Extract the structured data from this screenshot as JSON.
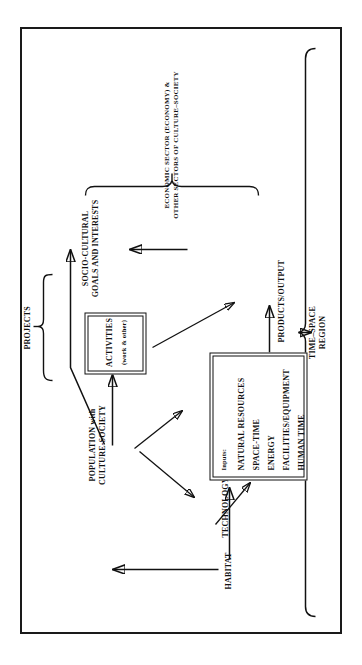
{
  "figure": {
    "orientation": "rotated-90-counterclockwise",
    "line_color": "#111111",
    "background": "#ffffff"
  },
  "nodes": {
    "habitat": "HABITAT",
    "population_line1": "POPULATION  with",
    "population_line2": "CULTURE-SOCIETY",
    "technology": "TECHNOLOGY",
    "products_output": "PRODUCTS/OUTPUT",
    "projects": "PROJECTS",
    "time_space_line1": "TIME–SPACE",
    "time_space_line2": "REGION",
    "socio_line1": "SOCIO-CULTURAL",
    "socio_line2": "GOALS AND INTERESTS",
    "economic_line1": "ECONOMIC SECTOR (ECONOMY) &",
    "economic_line2": "OTHER SECTORS OF CULTURE–SOCIETY"
  },
  "inputs_box": {
    "heading": "Inputs:",
    "items": [
      "NATURAL RESOURCES",
      "SPACE-TIME",
      "ENERGY",
      "FACILITIES/EQUIPMENT",
      "HUMAN TIME"
    ]
  },
  "activities_box": {
    "title": "ACTIVITIES",
    "subtitle": "(work & other)"
  }
}
